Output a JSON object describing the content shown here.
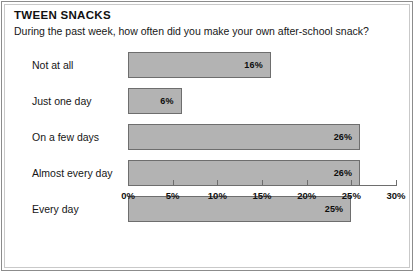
{
  "chart_data": {
    "type": "bar",
    "orientation": "horizontal",
    "title": "TWEEN SNACKS",
    "subtitle": "During the past week, how often did you make your own after-school snack?",
    "categories": [
      "Not at all",
      "Just one day",
      "On a few days",
      "Almost every day",
      "Every day"
    ],
    "values": [
      16,
      6,
      26,
      26,
      25
    ],
    "value_labels": [
      "16%",
      "6%",
      "26%",
      "26%",
      "25%"
    ],
    "xlabel": "",
    "ylabel": "",
    "xlim": [
      0,
      30
    ],
    "xticks": [
      0,
      5,
      10,
      15,
      20,
      25,
      30
    ],
    "xtick_labels": [
      "0%",
      "5%",
      "10%",
      "15%",
      "20%",
      "25%",
      "30%"
    ],
    "grid": false,
    "legend": false,
    "bar_color": "#b3b3b3",
    "bar_border_color": "#6e6e6e",
    "axis_color": "#6e6e6e",
    "text_color": "#111111",
    "background": "#ffffff"
  }
}
